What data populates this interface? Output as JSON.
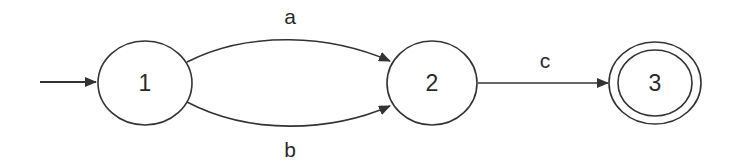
{
  "diagram": {
    "type": "finite-automaton",
    "states": [
      {
        "id": "1",
        "label": "1",
        "initial": true,
        "accepting": false
      },
      {
        "id": "2",
        "label": "2",
        "initial": false,
        "accepting": false
      },
      {
        "id": "3",
        "label": "3",
        "initial": false,
        "accepting": true
      }
    ],
    "transitions": [
      {
        "from": "1",
        "to": "2",
        "label": "a"
      },
      {
        "from": "1",
        "to": "2",
        "label": "b"
      },
      {
        "from": "2",
        "to": "3",
        "label": "c"
      }
    ],
    "colors": {
      "stroke": "#333333",
      "background": "#ffffff"
    }
  }
}
